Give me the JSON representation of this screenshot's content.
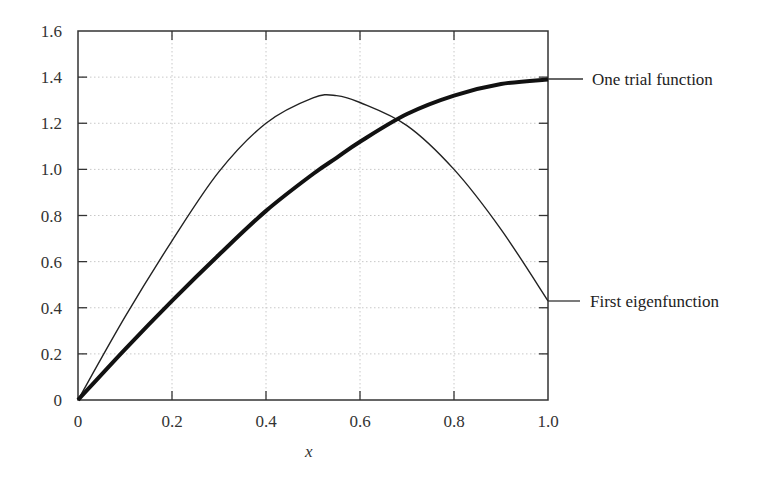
{
  "chart_data": {
    "type": "line",
    "title": "",
    "xlabel": "x",
    "ylabel": "",
    "xlim": [
      0,
      1.0
    ],
    "ylim": [
      0,
      1.6
    ],
    "grid": true,
    "grid_style": "dotted",
    "legend_position": "right, leader-line annotations",
    "x_ticks": [
      "0",
      "0.2",
      "0.4",
      "0.6",
      "0.8",
      "1.0"
    ],
    "y_ticks": [
      "0",
      "0.2",
      "0.4",
      "0.6",
      "0.8",
      "1.0",
      "1.2",
      "1.4",
      "1.6"
    ],
    "x": [
      0,
      0.1,
      0.2,
      0.3,
      0.4,
      0.5,
      0.55,
      0.6,
      0.7,
      0.8,
      0.9,
      1.0
    ],
    "series": [
      {
        "name": "One trial function",
        "style": "thick",
        "values": [
          0,
          0.22,
          0.43,
          0.63,
          0.82,
          0.98,
          1.05,
          1.12,
          1.24,
          1.32,
          1.37,
          1.39
        ]
      },
      {
        "name": "First eigenfunction",
        "style": "thin",
        "values": [
          0,
          0.36,
          0.69,
          0.99,
          1.2,
          1.31,
          1.32,
          1.29,
          1.19,
          1.0,
          0.74,
          0.43
        ]
      }
    ],
    "annotations": [
      {
        "text": "One trial function",
        "points_to": "thick curve at x=1.0, y≈1.39"
      },
      {
        "text": "First eigenfunction",
        "points_to": "thin curve at x=1.0, y≈0.43"
      }
    ]
  },
  "labels": {
    "x_axis_title": "x",
    "series_1": "One trial function",
    "series_2": "First eigenfunction"
  }
}
